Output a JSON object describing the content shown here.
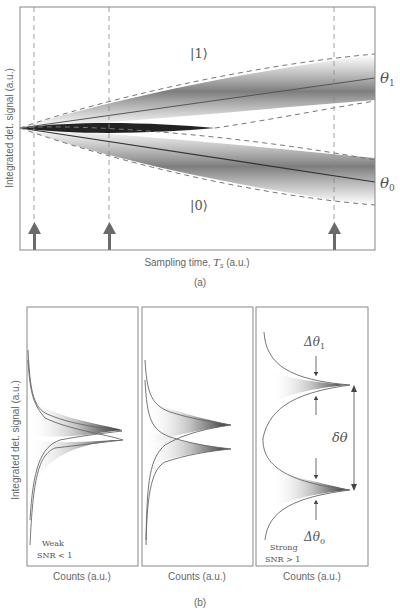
{
  "panel_a": {
    "caption": "(a)",
    "ylabel": "Integrated det. signal (a.u.)",
    "xlabel_prefix": "Sampling time, ",
    "xlabel_var": "T",
    "xlabel_sub": "s",
    "xlabel_suffix": " (a.u.)",
    "state_1": "|1⟩",
    "state_0": "|0⟩",
    "theta1_label": "θ",
    "theta1_sub": "1",
    "theta0_label": "θ",
    "theta0_sub": "0",
    "sampling_arrows_count": 3
  },
  "panel_b": {
    "caption": "(b)",
    "ylabel": "Integrated det. signal (a.u.)",
    "subpanels": [
      {
        "xlabel": "Counts (a.u.)",
        "note_line1": "Weak",
        "note_line2": "SNR < 1"
      },
      {
        "xlabel": "Counts (a.u.)"
      },
      {
        "xlabel": "Counts (a.u.)",
        "note_line1": "Strong",
        "note_line2": "SNR > 1",
        "delta_theta1": "Δθ",
        "delta_theta1_sub": "1",
        "delta_theta0": "Δθ",
        "delta_theta0_sub": "0",
        "separation": "δθ"
      }
    ]
  },
  "colors": {
    "frame": "#777777",
    "curve": "#666666",
    "band": "#555555",
    "arrow": "#6a6a6a"
  }
}
